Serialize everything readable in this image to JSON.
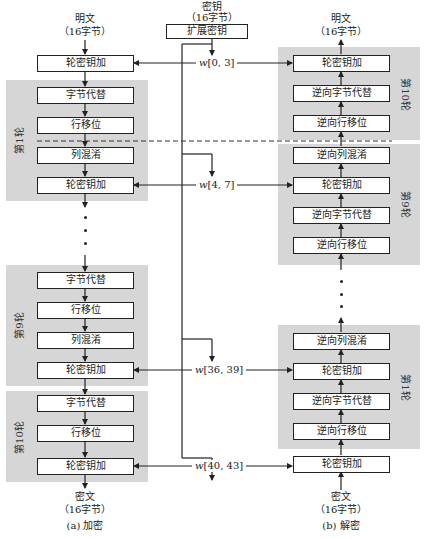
{
  "encryption": {
    "input_label": "明文",
    "input_size": "（16字节）",
    "initial_add_round_key": "轮密钥加",
    "rounds": [
      {
        "label": "第1轮",
        "steps": [
          "字节代替",
          "行移位",
          "列混淆",
          "轮密钥加"
        ]
      },
      {
        "label": "第9轮",
        "steps": [
          "字节代替",
          "行移位",
          "列混淆",
          "轮密钥加"
        ]
      },
      {
        "label": "第10轮",
        "steps": [
          "字节代替",
          "行移位",
          "轮密钥加"
        ]
      }
    ],
    "output_label": "密文",
    "output_size": "（16字节）",
    "caption": "(a) 加密"
  },
  "key": {
    "label": "密钥",
    "size": "（16字节）",
    "expand_label": "扩展密钥",
    "words": [
      {
        "prefix": "w",
        "range": "[0, 3]"
      },
      {
        "prefix": "w",
        "range": "[4, 7]"
      },
      {
        "prefix": "w",
        "range": "[36, 39]"
      },
      {
        "prefix": "w",
        "range": "[40, 43]"
      }
    ]
  },
  "decryption": {
    "output_label": "明文",
    "output_size": "（16字节）",
    "rounds": [
      {
        "label": "第10轮",
        "steps": [
          "轮密钥加",
          "逆向字节代替",
          "逆向行移位"
        ]
      },
      {
        "label": "第9轮",
        "steps": [
          "逆向列混淆",
          "轮密钥加",
          "逆向字节代替",
          "逆向行移位"
        ]
      },
      {
        "label": "第1轮",
        "steps": [
          "逆向列混淆",
          "轮密钥加",
          "逆向字节代替",
          "逆向行移位"
        ]
      }
    ],
    "initial_add_round_key": "轮密钥加",
    "input_label": "密文",
    "input_size": "（16字节）",
    "caption": "(b) 解密"
  }
}
